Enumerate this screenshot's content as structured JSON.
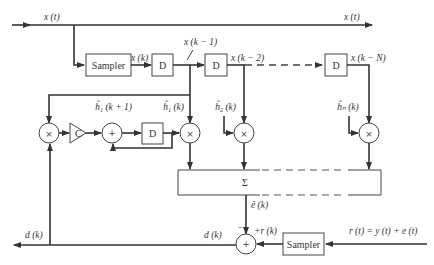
{
  "diagram": {
    "signals": {
      "input_left": "x (t)",
      "input_right": "x (t)",
      "x_k": "x (k)",
      "x_k1": "x (k − 1)",
      "x_k2": "x (k − 2)",
      "x_kN": "x (k − N)",
      "h1_next": "ĥ₁ (k + 1)",
      "h1": "ĥ₁ (k)",
      "h2": "ĥ₂ (k)",
      "hn": "ĥₙ (k)",
      "e_hat": "ê (k)",
      "d_out": "d (k)",
      "d_mid": "d (k)",
      "r_k": "+r (k)",
      "minus": "−",
      "r_t": "r (t) = y (t) + e (t)"
    },
    "blocks": {
      "sampler_top": "Sampler",
      "sampler_bottom": "Sampler",
      "delay_1": "D",
      "delay_2": "D",
      "delay_n": "D",
      "delay_feedback": "D",
      "gain": "C",
      "sum_box": "Σ",
      "adder_feedback": "+",
      "adder_output": "+",
      "multiplier": "×"
    }
  }
}
